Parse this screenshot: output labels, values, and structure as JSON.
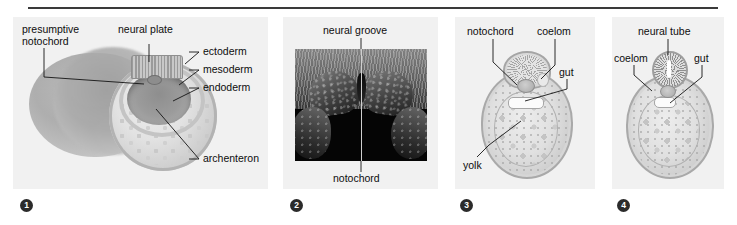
{
  "figure": {
    "panels": [
      {
        "number": "1",
        "type": "illustration",
        "labels": [
          {
            "name": "presumptive-notochord",
            "text": "presumptive\nnotochord"
          },
          {
            "name": "neural-plate",
            "text": "neural plate"
          },
          {
            "name": "ectoderm",
            "text": "ectoderm"
          },
          {
            "name": "mesoderm",
            "text": "mesoderm"
          },
          {
            "name": "endoderm",
            "text": "endoderm"
          },
          {
            "name": "archenteron",
            "text": "archenteron"
          }
        ]
      },
      {
        "number": "2",
        "type": "micrograph",
        "labels": [
          {
            "name": "neural-groove",
            "text": "neural groove"
          },
          {
            "name": "notochord",
            "text": "notochord"
          }
        ]
      },
      {
        "number": "3",
        "type": "illustration",
        "labels": [
          {
            "name": "notochord",
            "text": "notochord"
          },
          {
            "name": "coelom",
            "text": "coelom"
          },
          {
            "name": "gut",
            "text": "gut"
          },
          {
            "name": "yolk",
            "text": "yolk"
          }
        ]
      },
      {
        "number": "4",
        "type": "illustration",
        "labels": [
          {
            "name": "neural-tube",
            "text": "neural tube"
          },
          {
            "name": "coelom",
            "text": "coelom"
          },
          {
            "name": "gut",
            "text": "gut"
          }
        ]
      }
    ]
  },
  "panel1": {
    "presumptive_notochord": "presumptive",
    "presumptive_notochord2": "notochord",
    "neural_plate": "neural plate",
    "ectoderm": "ectoderm",
    "mesoderm": "mesoderm",
    "endoderm": "endoderm",
    "archenteron": "archenteron",
    "badge": "1"
  },
  "panel2": {
    "neural_groove": "neural groove",
    "notochord": "notochord",
    "badge": "2"
  },
  "panel3": {
    "notochord": "notochord",
    "coelom": "coelom",
    "gut": "gut",
    "yolk": "yolk",
    "badge": "3"
  },
  "panel4": {
    "neural_tube": "neural tube",
    "coelom": "coelom",
    "gut": "gut",
    "badge": "4"
  },
  "colors": {
    "page_background": "#ffffff",
    "panel_background": "#f1f1f1",
    "rule": "#3a3a3a",
    "label_text": "#0d0d0d",
    "badge_background": "#2b2b2b",
    "badge_text": "#ffffff",
    "micrograph_background": "#050505"
  }
}
